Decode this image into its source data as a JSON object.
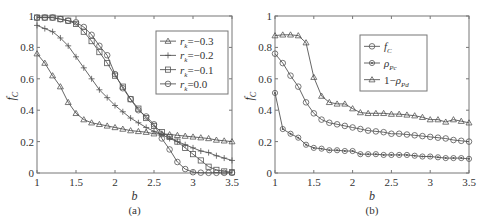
{
  "chart_data": [
    {
      "id": "a",
      "type": "line",
      "caption": "(a)",
      "xlabel": "b",
      "ylabel": "f_C",
      "xlim": [
        1,
        3.5
      ],
      "ylim": [
        0,
        1
      ],
      "xticks": [
        "1",
        "1.5",
        "2",
        "2.5",
        "3",
        "3.5"
      ],
      "yticks": [
        "0",
        "0.2",
        "0.4",
        "0.6",
        "0.8",
        "1"
      ],
      "grid": false,
      "legend_position": "upper right",
      "x": [
        1.0,
        1.1,
        1.2,
        1.3,
        1.4,
        1.5,
        1.6,
        1.7,
        1.8,
        1.9,
        2.0,
        2.1,
        2.2,
        2.3,
        2.4,
        2.5,
        2.6,
        2.7,
        2.8,
        2.9,
        3.0,
        3.1,
        3.2,
        3.3,
        3.4,
        3.5
      ],
      "series": [
        {
          "name": "r_k=-0.3",
          "label_main": "r",
          "label_sub": "k",
          "label_rest": "=−0.3",
          "marker": "triangle",
          "values": [
            0.76,
            0.7,
            0.62,
            0.55,
            0.45,
            0.38,
            0.34,
            0.32,
            0.31,
            0.3,
            0.29,
            0.28,
            0.27,
            0.265,
            0.26,
            0.25,
            0.25,
            0.245,
            0.24,
            0.235,
            0.23,
            0.225,
            0.22,
            0.21,
            0.205,
            0.2
          ]
        },
        {
          "name": "r_k=-0.2",
          "label_main": "r",
          "label_sub": "k",
          "label_rest": "=−0.2",
          "marker": "plus",
          "values": [
            0.94,
            0.92,
            0.9,
            0.86,
            0.81,
            0.74,
            0.67,
            0.6,
            0.53,
            0.48,
            0.43,
            0.39,
            0.35,
            0.32,
            0.29,
            0.265,
            0.245,
            0.22,
            0.2,
            0.18,
            0.16,
            0.14,
            0.13,
            0.11,
            0.095,
            0.08
          ]
        },
        {
          "name": "r_k=-0.1",
          "label_main": "r",
          "label_sub": "k",
          "label_rest": "=−0.1",
          "marker": "square",
          "values": [
            0.99,
            0.99,
            0.99,
            0.98,
            0.97,
            0.95,
            0.9,
            0.84,
            0.77,
            0.7,
            0.62,
            0.55,
            0.47,
            0.41,
            0.35,
            0.3,
            0.26,
            0.23,
            0.2,
            0.16,
            0.12,
            0.08,
            0.04,
            0.02,
            0.01,
            0.005
          ]
        },
        {
          "name": "r_k=0.0",
          "label_main": "r",
          "label_sub": "k",
          "label_rest": "=0.0",
          "marker": "circle",
          "values": [
            0.99,
            0.99,
            0.99,
            0.98,
            0.97,
            0.96,
            0.93,
            0.88,
            0.81,
            0.75,
            0.63,
            0.54,
            0.47,
            0.4,
            0.36,
            0.31,
            0.22,
            0.15,
            0.07,
            0.025,
            0.005,
            0.002,
            0.001,
            0.001,
            0.001,
            0.001
          ]
        }
      ]
    },
    {
      "id": "b",
      "type": "line",
      "caption": "(b)",
      "xlabel": "b",
      "ylabel": "f_C",
      "xlim": [
        1,
        3.5
      ],
      "ylim": [
        0,
        1
      ],
      "xticks": [
        "1",
        "1.5",
        "2",
        "2.5",
        "3",
        "3.5"
      ],
      "yticks": [
        "0",
        "0.2",
        "0.4",
        "0.6",
        "0.8",
        "1"
      ],
      "grid": false,
      "legend_position": "upper right",
      "x": [
        1.0,
        1.1,
        1.2,
        1.3,
        1.4,
        1.5,
        1.6,
        1.7,
        1.8,
        1.9,
        2.0,
        2.1,
        2.2,
        2.3,
        2.4,
        2.5,
        2.6,
        2.7,
        2.8,
        2.9,
        3.0,
        3.1,
        3.2,
        3.3,
        3.4,
        3.5
      ],
      "series": [
        {
          "name": "f_C",
          "label_main": "f",
          "label_sub": "C",
          "label_rest": "",
          "marker": "circle",
          "values": [
            0.76,
            0.7,
            0.62,
            0.55,
            0.45,
            0.38,
            0.34,
            0.32,
            0.31,
            0.3,
            0.29,
            0.28,
            0.27,
            0.265,
            0.26,
            0.25,
            0.25,
            0.245,
            0.24,
            0.235,
            0.23,
            0.225,
            0.22,
            0.21,
            0.205,
            0.2
          ]
        },
        {
          "name": "rho_Pc",
          "label_main": "ρ",
          "label_sub": "Pc",
          "label_rest": "",
          "marker": "dot-circle",
          "values": [
            0.51,
            0.28,
            0.25,
            0.225,
            0.18,
            0.16,
            0.155,
            0.145,
            0.145,
            0.14,
            0.14,
            0.12,
            0.12,
            0.12,
            0.115,
            0.115,
            0.115,
            0.115,
            0.11,
            0.105,
            0.105,
            0.1,
            0.095,
            0.095,
            0.095,
            0.09
          ]
        },
        {
          "name": "1-rho_Pd",
          "label_main": "1−ρ",
          "label_sub": "Pd",
          "label_rest": "",
          "marker": "triangle",
          "values": [
            0.875,
            0.88,
            0.88,
            0.875,
            0.83,
            0.61,
            0.49,
            0.45,
            0.44,
            0.44,
            0.41,
            0.385,
            0.38,
            0.38,
            0.38,
            0.375,
            0.375,
            0.37,
            0.365,
            0.355,
            0.34,
            0.34,
            0.325,
            0.34,
            0.33,
            0.32
          ]
        }
      ]
    }
  ],
  "style": {
    "line_color": "#555555",
    "axis_color": "#777777"
  }
}
